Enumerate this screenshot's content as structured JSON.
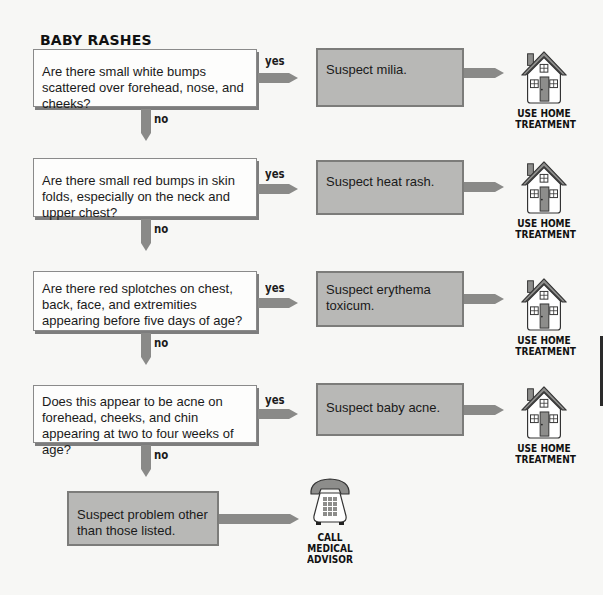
{
  "title": "BABY RASHES",
  "labels": {
    "yes": "yes",
    "no": "no"
  },
  "questions": [
    {
      "text": "Are there small white bumps scattered over forehead, nose, and cheeks?"
    },
    {
      "text": "Are there small red bumps in skin folds, especially on the neck and upper chest?"
    },
    {
      "text": "Are there red splotches on chest, back, face, and extremities appearing before five days of age?"
    },
    {
      "text": "Does this appear to be acne on forehead, cheeks, and chin appearing at two to four weeks of age?"
    }
  ],
  "results": [
    {
      "text": "Suspect milia.",
      "action_line1": "USE HOME",
      "action_line2": "TREATMENT",
      "icon": "house-icon"
    },
    {
      "text": "Suspect heat rash.",
      "action_line1": "USE HOME",
      "action_line2": "TREATMENT",
      "icon": "house-icon"
    },
    {
      "text": "Suspect erythema toxicum.",
      "action_line1": "USE HOME",
      "action_line2": "TREATMENT",
      "icon": "house-icon"
    },
    {
      "text": "Suspect baby acne.",
      "action_line1": "USE HOME",
      "action_line2": "TREATMENT",
      "icon": "house-icon"
    }
  ],
  "final": {
    "text": "Suspect problem other than those listed.",
    "action_line1": "CALL",
    "action_line2": "MEDICAL",
    "action_line3": "ADVISOR",
    "icon": "telephone-icon"
  },
  "colors": {
    "question_fill": "#fdfdfc",
    "result_fill": "#b8b8b6",
    "arrow": "#8a8a88",
    "door": "#8d8d8b"
  }
}
